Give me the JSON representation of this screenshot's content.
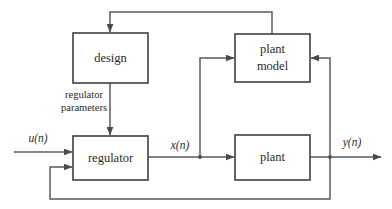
{
  "diagram": {
    "background_color": "#ffffff",
    "line_color": "#5a5a5a",
    "box_stroke_color": "#3f3f3f",
    "text_color": "#2b2b2b",
    "blocks": [
      {
        "id": "design",
        "label": "design",
        "label_line1": "design",
        "label_line2": "",
        "x": 73,
        "y": 33,
        "w": 75,
        "h": 50
      },
      {
        "id": "regulator",
        "label": "regulator",
        "label_line1": "regulator",
        "label_line2": "",
        "x": 73,
        "y": 136,
        "w": 75,
        "h": 44
      },
      {
        "id": "plant-model",
        "label": "plant model",
        "label_line1": "plant",
        "label_line2": "model",
        "x": 235,
        "y": 34,
        "w": 75,
        "h": 48
      },
      {
        "id": "plant",
        "label": "plant",
        "label_line1": "plant",
        "label_line2": "",
        "x": 235,
        "y": 135,
        "w": 75,
        "h": 45
      }
    ],
    "signals": [
      {
        "id": "input",
        "label": "u(n)",
        "x": 38,
        "y": 142
      },
      {
        "id": "state",
        "label": "x(n)",
        "x": 180,
        "y": 149
      },
      {
        "id": "output",
        "label": "y(n)",
        "x": 352,
        "y": 146
      }
    ],
    "annotations": [
      {
        "id": "regulator-parameters",
        "line1": "regulator",
        "line2": "parameters",
        "x": 84,
        "y": 98
      }
    ]
  }
}
